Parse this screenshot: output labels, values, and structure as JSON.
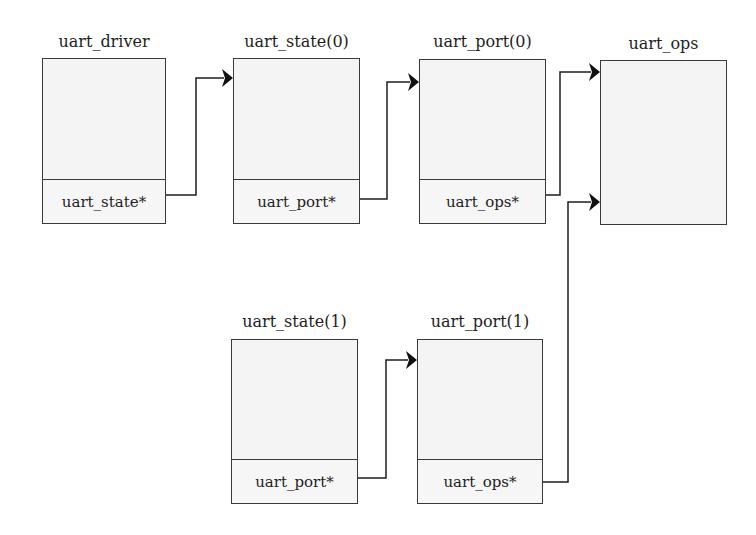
{
  "diagram": {
    "nodes": [
      {
        "id": "uart_driver",
        "title": "uart_driver",
        "field": "uart_state*"
      },
      {
        "id": "uart_state0",
        "title": "uart_state(0)",
        "field": "uart_port*"
      },
      {
        "id": "uart_port0",
        "title": "uart_port(0)",
        "field": "uart_ops*"
      },
      {
        "id": "uart_ops",
        "title": "uart_ops",
        "field": null
      },
      {
        "id": "uart_state1",
        "title": "uart_state(1)",
        "field": "uart_port*"
      },
      {
        "id": "uart_port1",
        "title": "uart_port(1)",
        "field": "uart_ops*"
      }
    ],
    "edges": [
      {
        "from": "uart_driver.uart_state*",
        "to": "uart_state0"
      },
      {
        "from": "uart_state0.uart_port*",
        "to": "uart_port0"
      },
      {
        "from": "uart_port0.uart_ops*",
        "to": "uart_ops"
      },
      {
        "from": "uart_state1.uart_port*",
        "to": "uart_port1"
      },
      {
        "from": "uart_port1.uart_ops*",
        "to": "uart_ops"
      }
    ],
    "colors": {
      "line": "#1e1e1e",
      "box_border": "#3a3a3a",
      "box_fill": "#f4f4f4"
    }
  }
}
